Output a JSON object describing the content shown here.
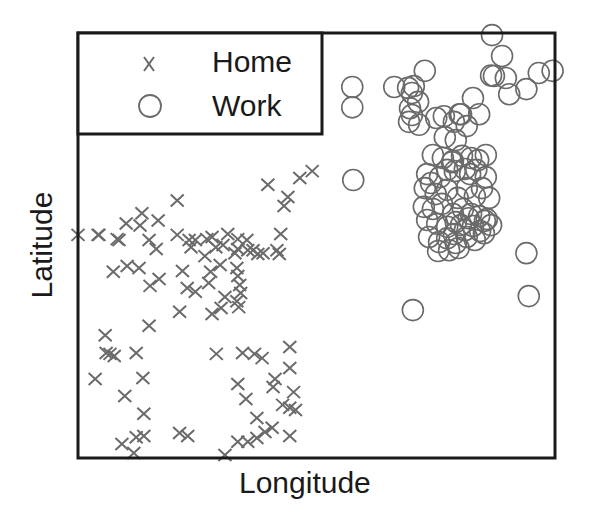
{
  "chart_data": {
    "type": "scatter",
    "title": "",
    "xlabel": "Longitude",
    "ylabel": "Latitude",
    "xlim": [
      0,
      100
    ],
    "ylim": [
      0,
      100
    ],
    "ticks": "none",
    "grid": false,
    "legend": {
      "position": "upper left",
      "entries": [
        {
          "label": "Home",
          "marker": "x"
        },
        {
          "label": "Work",
          "marker": "o"
        }
      ]
    },
    "series": [
      {
        "name": "Home",
        "marker": "x",
        "color": "#6a6a6a",
        "points": [
          [
            0,
            52.5
          ],
          [
            4.4,
            52.5
          ],
          [
            8.2,
            51.5
          ],
          [
            10.1,
            55.2
          ],
          [
            13,
            54.7
          ],
          [
            14.9,
            51.3
          ],
          [
            16.4,
            49.2
          ],
          [
            20.8,
            60.6
          ],
          [
            20.8,
            52.5
          ],
          [
            23.3,
            51.3
          ],
          [
            23.7,
            49.6
          ],
          [
            24.6,
            51.3
          ],
          [
            26.6,
            47.5
          ],
          [
            27,
            51.5
          ],
          [
            28.1,
            52
          ],
          [
            28.9,
            49.6
          ],
          [
            30.4,
            50.1
          ],
          [
            31.4,
            52.7
          ],
          [
            33.5,
            51.5
          ],
          [
            33.5,
            49.2
          ],
          [
            35.4,
            51.3
          ],
          [
            35.6,
            48.9
          ],
          [
            37.7,
            48
          ],
          [
            38.8,
            48.2
          ],
          [
            41.7,
            48.9
          ],
          [
            42.2,
            48
          ],
          [
            46.5,
            65.9
          ],
          [
            49.1,
            67.5
          ],
          [
            39.8,
            64.3
          ],
          [
            43.2,
            59.3
          ],
          [
            44,
            61.4
          ],
          [
            42.5,
            52.7
          ],
          [
            13.4,
            57.6
          ],
          [
            16.8,
            55.9
          ],
          [
            7.4,
            43.8
          ],
          [
            10.3,
            45.2
          ],
          [
            12.8,
            44.7
          ],
          [
            15.1,
            40.5
          ],
          [
            17,
            42.1
          ],
          [
            21.9,
            44
          ],
          [
            22.9,
            40
          ],
          [
            24.6,
            39.1
          ],
          [
            27.4,
            41.2
          ],
          [
            27.8,
            43.8
          ],
          [
            29.8,
            45.4
          ],
          [
            32.9,
            48.2
          ],
          [
            33.3,
            44.7
          ],
          [
            33.5,
            42.8
          ],
          [
            33.9,
            40.7
          ],
          [
            34.1,
            38.8
          ],
          [
            33.3,
            36.9
          ],
          [
            33.7,
            35.5
          ],
          [
            30.8,
            37.9
          ],
          [
            30,
            35.3
          ],
          [
            28.1,
            33.9
          ],
          [
            21.3,
            34.4
          ],
          [
            14.9,
            31.1
          ],
          [
            12.2,
            24.7
          ],
          [
            6.7,
            24.5
          ],
          [
            7.6,
            24
          ],
          [
            5.7,
            28.9
          ],
          [
            29,
            24.5
          ],
          [
            34.5,
            24.7
          ],
          [
            37,
            24.5
          ],
          [
            38.6,
            23.5
          ],
          [
            44.4,
            26.1
          ],
          [
            44.4,
            21.2
          ],
          [
            41.3,
            18.6
          ],
          [
            33.5,
            17.4
          ],
          [
            40.9,
            16.7
          ],
          [
            35.2,
            13.9
          ],
          [
            37.5,
            9.4
          ],
          [
            13.6,
            18.8
          ],
          [
            9.8,
            14.6
          ],
          [
            13.8,
            10.4
          ],
          [
            12.2,
            4.9
          ],
          [
            9.2,
            3.3
          ],
          [
            11.7,
            1.2
          ],
          [
            13.8,
            5.2
          ],
          [
            21.3,
            5.9
          ],
          [
            23,
            5.2
          ],
          [
            30.8,
            0.7
          ],
          [
            33.5,
            3.8
          ],
          [
            35.6,
            3.8
          ],
          [
            37.5,
            4.7
          ],
          [
            39.2,
            6.1
          ],
          [
            40.7,
            7.1
          ],
          [
            42.9,
            12.5
          ],
          [
            44.4,
            11.8
          ],
          [
            45.6,
            11.3
          ],
          [
            44.4,
            5.2
          ],
          [
            8.6,
            51.3
          ],
          [
            4.2,
            52.5
          ],
          [
            45.2,
            15.5
          ],
          [
            36.7,
            48.9
          ],
          [
            3.6,
            18.6
          ],
          [
            5.9,
            24.7
          ]
        ]
      },
      {
        "name": "Work",
        "marker": "o",
        "color": "#6a6a6a",
        "points": [
          [
            57.7,
            65.4
          ],
          [
            57.5,
            87.3
          ],
          [
            57.5,
            82.5
          ],
          [
            66.3,
            87.3
          ],
          [
            69.2,
            87.1
          ],
          [
            70,
            85.9
          ],
          [
            70.4,
            87.5
          ],
          [
            71.3,
            83.8
          ],
          [
            69.6,
            82.3
          ],
          [
            70,
            80.7
          ],
          [
            69.4,
            79.1
          ],
          [
            72.7,
            91.1
          ],
          [
            75.1,
            80
          ],
          [
            76.7,
            80.4
          ],
          [
            78.8,
            79.1
          ],
          [
            80,
            80.9
          ],
          [
            81.5,
            78.1
          ],
          [
            82.8,
            84.7
          ],
          [
            86.6,
            90
          ],
          [
            88.9,
            94.6
          ],
          [
            87.2,
            89.9
          ],
          [
            89.7,
            89.4
          ],
          [
            90.4,
            85.6
          ],
          [
            94,
            86.8
          ],
          [
            96.6,
            90.6
          ],
          [
            99.5,
            91.1
          ],
          [
            84.1,
            80.9
          ],
          [
            79.2,
            74.8
          ],
          [
            74.4,
            71.3
          ],
          [
            76.5,
            70.6
          ],
          [
            78.6,
            69.9
          ],
          [
            80.5,
            71.1
          ],
          [
            82.4,
            70.6
          ],
          [
            83.9,
            70.1
          ],
          [
            85.5,
            71.3
          ],
          [
            78.4,
            69.6
          ],
          [
            73.2,
            66.8
          ],
          [
            74,
            64.7
          ],
          [
            75.9,
            66.1
          ],
          [
            77.4,
            67.8
          ],
          [
            79,
            67.5
          ],
          [
            81.1,
            68
          ],
          [
            82.2,
            66.8
          ],
          [
            83.5,
            67.8
          ],
          [
            85.5,
            66.1
          ],
          [
            72.7,
            63.5
          ],
          [
            75,
            62.1
          ],
          [
            77.4,
            63.1
          ],
          [
            79.6,
            61.2
          ],
          [
            81.5,
            63.5
          ],
          [
            83.2,
            61.6
          ],
          [
            84.7,
            63.5
          ],
          [
            86.2,
            61.2
          ],
          [
            72.5,
            59.1
          ],
          [
            74.4,
            58.6
          ],
          [
            76.3,
            59.8
          ],
          [
            78.6,
            57.4
          ],
          [
            80.7,
            58.6
          ],
          [
            82.4,
            57.4
          ],
          [
            84.1,
            56.9
          ],
          [
            85.7,
            56.2
          ],
          [
            73.2,
            56
          ],
          [
            75.3,
            55.1
          ],
          [
            77.4,
            54.4
          ],
          [
            79.2,
            55.5
          ],
          [
            81.1,
            53.6
          ],
          [
            82.8,
            54.6
          ],
          [
            84.3,
            53.4
          ],
          [
            86.6,
            54.8
          ],
          [
            73.6,
            52
          ],
          [
            75.7,
            50.8
          ],
          [
            77.4,
            51.7
          ],
          [
            79.2,
            50.6
          ],
          [
            81.5,
            52
          ],
          [
            83.2,
            51.3
          ],
          [
            85.1,
            52.9
          ],
          [
            78.8,
            52.7
          ],
          [
            80.3,
            54.8
          ],
          [
            81.9,
            56.4
          ],
          [
            75.5,
            48.7
          ],
          [
            77.8,
            48.9
          ],
          [
            79.8,
            49.4
          ],
          [
            85.3,
            55.8
          ],
          [
            94,
            48.2
          ],
          [
            70.2,
            34.8
          ],
          [
            94.5,
            38.1
          ],
          [
            86.8,
            99.5
          ],
          [
            80.3,
            80.9
          ],
          [
            71.5,
            78.4
          ],
          [
            76.9,
            75.5
          ]
        ]
      }
    ]
  },
  "legend": {
    "home_label": "Home",
    "work_label": "Work"
  },
  "axes": {
    "xlabel": "Longitude",
    "ylabel": "Latitude"
  }
}
